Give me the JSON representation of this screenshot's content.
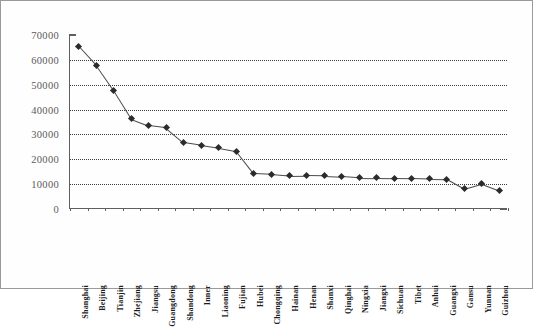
{
  "chart_data": {
    "type": "line",
    "title": "",
    "subtitle": "",
    "xlabel": "",
    "ylabel": "",
    "ylim": [
      0,
      70000
    ],
    "ytick_labels": [
      "70000",
      "60000",
      "50000",
      "40000",
      "30000",
      "20000",
      "10000",
      "0"
    ],
    "ytick_values": [
      70000,
      60000,
      50000,
      40000,
      30000,
      20000,
      10000,
      0
    ],
    "grid": "horizontal-dotted",
    "legend": "none",
    "marker": "diamond",
    "line_color": "#4a4a4a",
    "marker_color": "#2b2b2b",
    "grid_color": "#3a3a3a",
    "axis_color": "#5f5f5f",
    "categories": [
      "Shanghai",
      "Beijing",
      "Tianjin",
      "Zhejiang",
      "Jiangsu",
      "Guangdong",
      "Shandong",
      "Inner",
      "Liaoning",
      "Fujian",
      "Hubei",
      "Chongqing",
      "Hainan",
      "Henan",
      "Shanxi",
      "Qinghai",
      "Ningxia",
      "Jiangxi",
      "Sichuan",
      "Tibet",
      "Anhui",
      "Guangxi",
      "Gansu",
      "Yunnan",
      "Guizhou"
    ],
    "values": [
      65500,
      57800,
      47600,
      36300,
      33600,
      32700,
      26800,
      25700,
      24600,
      23300,
      14300,
      14000,
      13400,
      13500,
      13400,
      13100,
      12600,
      12500,
      12400,
      12300,
      12100,
      12000,
      8100,
      10100,
      7400
    ]
  }
}
